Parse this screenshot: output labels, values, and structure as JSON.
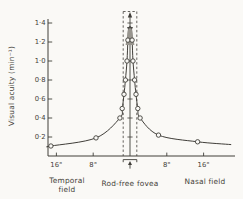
{
  "figure": {
    "background": "#faf9f6",
    "ink": "#403e39",
    "shade_color": "#98958e",
    "text_color": "#454239"
  },
  "chart_data": {
    "type": "line",
    "title": "",
    "ylabel": "Visual acuity (min⁻¹)",
    "ylim": [
      0,
      1.5
    ],
    "y_ticks": [
      0.2,
      0.4,
      0.6,
      0.8,
      1.0,
      1.2,
      1.4
    ],
    "y_tick_labels": [
      "0·2",
      "0·4",
      "0·6",
      "0·8",
      "1·0",
      "1·2",
      "1·4"
    ],
    "x_unit": "degrees from fovea center",
    "xlim": [
      -18.5,
      23
    ],
    "x_ticks": [
      {
        "deg": -16,
        "label": "16°"
      },
      {
        "deg": -8,
        "label": "8°"
      },
      {
        "deg": 8,
        "label": "8°"
      },
      {
        "deg": 16,
        "label": "16°"
      }
    ],
    "field_labels": {
      "left": "Temporal field",
      "center": "Rod-free fovea",
      "right": "Nasal field"
    },
    "series": [
      {
        "name": "Visual acuity",
        "marker": "open-circle",
        "points": [
          {
            "deg": -17.8,
            "acuity": 0.1,
            "marker": false
          },
          {
            "deg": -17.2,
            "acuity": 0.105,
            "marker": true
          },
          {
            "deg": -7.4,
            "acuity": 0.19,
            "marker": true
          },
          {
            "deg": -2.2,
            "acuity": 0.4,
            "marker": true
          },
          {
            "deg": -1.7,
            "acuity": 0.5,
            "marker": true
          },
          {
            "deg": -1.3,
            "acuity": 0.65,
            "marker": true
          },
          {
            "deg": -1.0,
            "acuity": 0.8,
            "marker": true
          },
          {
            "deg": -0.65,
            "acuity": 1.0,
            "marker": true
          },
          {
            "deg": -0.45,
            "acuity": 1.22,
            "marker": true
          },
          {
            "deg": -0.28,
            "acuity": 1.35,
            "marker": false
          },
          {
            "deg": 0.28,
            "acuity": 1.35,
            "marker": false
          },
          {
            "deg": 0.45,
            "acuity": 1.22,
            "marker": true
          },
          {
            "deg": 0.65,
            "acuity": 1.0,
            "marker": true
          },
          {
            "deg": 1.0,
            "acuity": 0.8,
            "marker": true
          },
          {
            "deg": 1.3,
            "acuity": 0.65,
            "marker": true
          },
          {
            "deg": 1.7,
            "acuity": 0.5,
            "marker": true
          },
          {
            "deg": 2.2,
            "acuity": 0.4,
            "marker": true
          },
          {
            "deg": 6.2,
            "acuity": 0.22,
            "marker": true
          },
          {
            "deg": 14.7,
            "acuity": 0.15,
            "marker": true
          },
          {
            "deg": 22.0,
            "acuity": 0.12,
            "marker": false
          }
        ]
      }
    ],
    "fovea_marker": {
      "band_deg": [
        -1.48,
        1.48
      ],
      "peak_offscale_arrow": true,
      "shaded_peak_above_acuity": 1.17,
      "peak_cap_acuity": 1.35
    }
  }
}
